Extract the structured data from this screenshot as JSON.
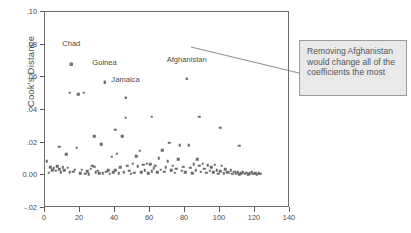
{
  "chart_data": {
    "type": "scatter",
    "title": "",
    "xlabel": "",
    "ylabel": "Cook's Distance",
    "xlim": [
      0,
      140
    ],
    "ylim": [
      -0.02,
      0.1
    ],
    "grid": false,
    "legend": "none",
    "xticks": [
      "0",
      "20",
      "40",
      "60",
      "80",
      "100",
      "120",
      "140"
    ],
    "xtick_values": [
      0,
      20,
      40,
      60,
      80,
      100,
      120,
      140
    ],
    "yticks": [
      ".10",
      ".08",
      ".06",
      ".04",
      ".02",
      "0.00",
      "-.02"
    ],
    "ytick_values": [
      0.1,
      0.08,
      0.06,
      0.04,
      0.02,
      0.0,
      -0.02
    ],
    "marker": "square",
    "marker_color": "#6b6b6b",
    "annotations": [
      {
        "text": "Chad",
        "x": 15,
        "y": 0.0805
      },
      {
        "text": "Guinea",
        "x": 34,
        "y": 0.0685
      },
      {
        "text": "Jamaica",
        "x": 46,
        "y": 0.0585
      },
      {
        "text": "Afghanistan",
        "x": 81,
        "y": 0.0705
      }
    ],
    "labeled_points": [
      {
        "name": "Chad",
        "x": 15,
        "y": 0.068
      },
      {
        "name": "Guinea",
        "x": 34,
        "y": 0.057
      },
      {
        "name": "Jamaica",
        "x": 46,
        "y": 0.0475
      },
      {
        "name": "Afghanistan",
        "x": 81,
        "y": 0.059
      }
    ],
    "points": [
      {
        "x": 1,
        "y": 0.0085
      },
      {
        "x": 2,
        "y": 0.0015
      },
      {
        "x": 3,
        "y": 0.005
      },
      {
        "x": 4,
        "y": 0.003
      },
      {
        "x": 5,
        "y": 0.0042
      },
      {
        "x": 6,
        "y": 0.0028
      },
      {
        "x": 7,
        "y": 0.0055
      },
      {
        "x": 8,
        "y": 0.0175
      },
      {
        "x": 8,
        "y": 0.0038
      },
      {
        "x": 9,
        "y": 0.002
      },
      {
        "x": 10,
        "y": 0.0048
      },
      {
        "x": 11,
        "y": 0.0032
      },
      {
        "x": 12,
        "y": 0.013
      },
      {
        "x": 13,
        "y": 0.0045
      },
      {
        "x": 14,
        "y": 0.0505
      },
      {
        "x": 14,
        "y": 0.0018
      },
      {
        "x": 15,
        "y": 0.068
      },
      {
        "x": 16,
        "y": 0.0022
      },
      {
        "x": 17,
        "y": 0.0035
      },
      {
        "x": 18,
        "y": 0.0168
      },
      {
        "x": 19,
        "y": 0.0495
      },
      {
        "x": 20,
        "y": 0.0012
      },
      {
        "x": 21,
        "y": 0.0035
      },
      {
        "x": 22,
        "y": 0.0505
      },
      {
        "x": 23,
        "y": 0.001
      },
      {
        "x": 24,
        "y": 0.0025
      },
      {
        "x": 25,
        "y": 0.0008
      },
      {
        "x": 26,
        "y": 0.004
      },
      {
        "x": 27,
        "y": 0.006
      },
      {
        "x": 28,
        "y": 0.024
      },
      {
        "x": 28,
        "y": 0.0052
      },
      {
        "x": 29,
        "y": 0.0018
      },
      {
        "x": 30,
        "y": 0.0028
      },
      {
        "x": 31,
        "y": 0.0012
      },
      {
        "x": 32,
        "y": 0.019
      },
      {
        "x": 33,
        "y": 0.0014
      },
      {
        "x": 34,
        "y": 0.057
      },
      {
        "x": 35,
        "y": 0.0022
      },
      {
        "x": 36,
        "y": 0.0032
      },
      {
        "x": 37,
        "y": 0.001
      },
      {
        "x": 38,
        "y": 0.0115
      },
      {
        "x": 39,
        "y": 0.002
      },
      {
        "x": 40,
        "y": 0.028
      },
      {
        "x": 40,
        "y": 0.003
      },
      {
        "x": 41,
        "y": 0.0132
      },
      {
        "x": 42,
        "y": 0.0012
      },
      {
        "x": 43,
        "y": 0.005
      },
      {
        "x": 44,
        "y": 0.024
      },
      {
        "x": 45,
        "y": 0.0018
      },
      {
        "x": 46,
        "y": 0.0475
      },
      {
        "x": 46,
        "y": 0.0352
      },
      {
        "x": 47,
        "y": 0.006
      },
      {
        "x": 48,
        "y": 0.0028
      },
      {
        "x": 49,
        "y": 0.001
      },
      {
        "x": 50,
        "y": 0.0072
      },
      {
        "x": 51,
        "y": 0.0015
      },
      {
        "x": 52,
        "y": 0.0118
      },
      {
        "x": 53,
        "y": 0.0055
      },
      {
        "x": 54,
        "y": 0.015
      },
      {
        "x": 55,
        "y": 0.002
      },
      {
        "x": 56,
        "y": 0.0065
      },
      {
        "x": 57,
        "y": 0.0032
      },
      {
        "x": 58,
        "y": 0.007
      },
      {
        "x": 59,
        "y": 0.0012
      },
      {
        "x": 60,
        "y": 0.0068
      },
      {
        "x": 61,
        "y": 0.0358
      },
      {
        "x": 61,
        "y": 0.0025
      },
      {
        "x": 62,
        "y": 0.0042
      },
      {
        "x": 63,
        "y": 0.006
      },
      {
        "x": 64,
        "y": 0.0018
      },
      {
        "x": 65,
        "y": 0.0105
      },
      {
        "x": 66,
        "y": 0.0035
      },
      {
        "x": 67,
        "y": 0.0155
      },
      {
        "x": 68,
        "y": 0.0022
      },
      {
        "x": 69,
        "y": 0.0048
      },
      {
        "x": 70,
        "y": 0.0085
      },
      {
        "x": 71,
        "y": 0.02
      },
      {
        "x": 72,
        "y": 0.003
      },
      {
        "x": 73,
        "y": 0.0058
      },
      {
        "x": 74,
        "y": 0.0015
      },
      {
        "x": 75,
        "y": 0.004
      },
      {
        "x": 76,
        "y": 0.01
      },
      {
        "x": 77,
        "y": 0.0185
      },
      {
        "x": 78,
        "y": 0.0028
      },
      {
        "x": 79,
        "y": 0.0052
      },
      {
        "x": 80,
        "y": 0.002
      },
      {
        "x": 81,
        "y": 0.059
      },
      {
        "x": 82,
        "y": 0.0185
      },
      {
        "x": 83,
        "y": 0.0045
      },
      {
        "x": 84,
        "y": 0.0012
      },
      {
        "x": 85,
        "y": 0.0068
      },
      {
        "x": 86,
        "y": 0.003
      },
      {
        "x": 87,
        "y": 0.01
      },
      {
        "x": 88,
        "y": 0.0358
      },
      {
        "x": 88,
        "y": 0.0058
      },
      {
        "x": 89,
        "y": 0.0022
      },
      {
        "x": 90,
        "y": 0.007
      },
      {
        "x": 91,
        "y": 0.004
      },
      {
        "x": 92,
        "y": 0.0015
      },
      {
        "x": 93,
        "y": 0.0062
      },
      {
        "x": 94,
        "y": 0.0028
      },
      {
        "x": 95,
        "y": 0.0048
      },
      {
        "x": 96,
        "y": 0.0018
      },
      {
        "x": 97,
        "y": 0.0065
      },
      {
        "x": 98,
        "y": 0.0032
      },
      {
        "x": 99,
        "y": 0.001
      },
      {
        "x": 100,
        "y": 0.029
      },
      {
        "x": 100,
        "y": 0.0025
      },
      {
        "x": 101,
        "y": 0.0058
      },
      {
        "x": 102,
        "y": 0.0012
      },
      {
        "x": 103,
        "y": 0.0038
      },
      {
        "x": 104,
        "y": 0.002
      },
      {
        "x": 105,
        "y": 0.0015
      },
      {
        "x": 106,
        "y": 0.003
      },
      {
        "x": 107,
        "y": 0.001
      },
      {
        "x": 108,
        "y": 0.0022
      },
      {
        "x": 109,
        "y": 0.0014
      },
      {
        "x": 110,
        "y": 0.0018
      },
      {
        "x": 111,
        "y": 0.018
      },
      {
        "x": 111,
        "y": 0.0008
      },
      {
        "x": 112,
        "y": 0.0012
      },
      {
        "x": 113,
        "y": 0.002
      },
      {
        "x": 114,
        "y": 0.001
      },
      {
        "x": 115,
        "y": 0.0015
      },
      {
        "x": 116,
        "y": 0.0008
      },
      {
        "x": 117,
        "y": 0.0012
      },
      {
        "x": 118,
        "y": 0.0018
      },
      {
        "x": 119,
        "y": 0.001
      },
      {
        "x": 120,
        "y": 0.0014
      },
      {
        "x": 121,
        "y": 0.0008
      },
      {
        "x": 122,
        "y": 0.0012
      },
      {
        "x": 123,
        "y": 0.001
      }
    ]
  },
  "callout": {
    "text": "Removing Afghanistan would change all of the coefficients the most",
    "background": "#e9e9e9",
    "border_color": "#9a9a9a"
  }
}
